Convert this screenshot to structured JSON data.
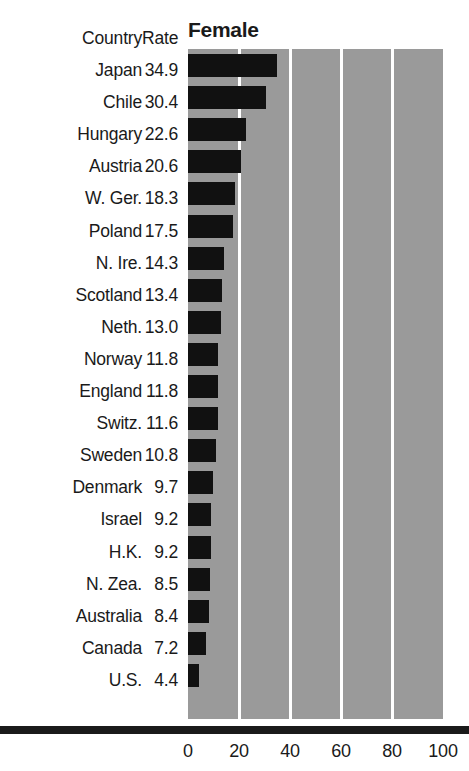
{
  "chart_data": {
    "type": "bar",
    "orientation": "horizontal",
    "title": "Female",
    "xlabel": "",
    "ylabel": "",
    "xlim": [
      0,
      100
    ],
    "xticks": [
      0,
      20,
      40,
      60,
      80,
      100
    ],
    "grid": true,
    "legend": null,
    "categories": [
      "Japan",
      "Chile",
      "Hungary",
      "Austria",
      "W. Ger.",
      "Poland",
      "N. Ire.",
      "Scotland",
      "Neth.",
      "Norway",
      "England",
      "Switz.",
      "Sweden",
      "Denmark",
      "Israel",
      "H.K.",
      "N. Zea.",
      "Australia",
      "Canada",
      "U.S."
    ],
    "values": [
      34.9,
      30.4,
      22.6,
      20.6,
      18.3,
      17.5,
      14.3,
      13.4,
      13.0,
      11.8,
      11.8,
      11.6,
      10.8,
      9.7,
      9.2,
      9.2,
      8.5,
      8.4,
      7.2,
      4.4
    ],
    "bar_color": "#111111",
    "plot_background_color": "#9a9a9a",
    "gridline_color": "#ffffff"
  },
  "table": {
    "headers": {
      "country": "Country",
      "rate": "Rate"
    },
    "rows": [
      {
        "country": "Japan",
        "rate": "34.9"
      },
      {
        "country": "Chile",
        "rate": "30.4"
      },
      {
        "country": "Hungary",
        "rate": "22.6"
      },
      {
        "country": "Austria",
        "rate": "20.6"
      },
      {
        "country": "W. Ger.",
        "rate": "18.3"
      },
      {
        "country": "Poland",
        "rate": "17.5"
      },
      {
        "country": "N. Ire.",
        "rate": "14.3"
      },
      {
        "country": "Scotland",
        "rate": "13.4"
      },
      {
        "country": "Neth.",
        "rate": "13.0"
      },
      {
        "country": "Norway",
        "rate": "11.8"
      },
      {
        "country": "England",
        "rate": "11.8"
      },
      {
        "country": "Switz.",
        "rate": "11.6"
      },
      {
        "country": "Sweden",
        "rate": "10.8"
      },
      {
        "country": "Denmark",
        "rate": "9.7"
      },
      {
        "country": "Israel",
        "rate": "9.2"
      },
      {
        "country": "H.K.",
        "rate": "9.2"
      },
      {
        "country": "N. Zea.",
        "rate": "8.5"
      },
      {
        "country": "Australia",
        "rate": "8.4"
      },
      {
        "country": "Canada",
        "rate": "7.2"
      },
      {
        "country": "U.S.",
        "rate": "4.4"
      }
    ]
  },
  "axis": {
    "ticklabels": [
      "0",
      "20",
      "40",
      "60",
      "80",
      "100"
    ]
  }
}
